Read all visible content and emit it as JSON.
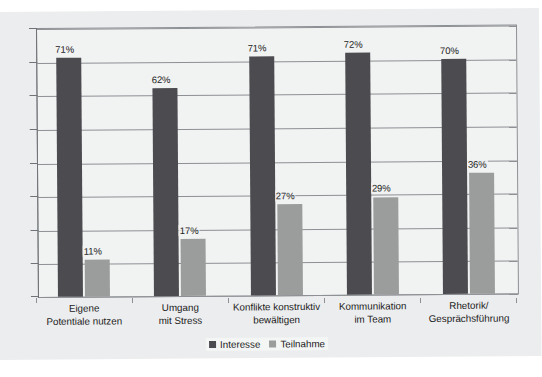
{
  "chart_data": {
    "type": "bar",
    "title": "",
    "subtitle": "",
    "xlabel": "",
    "ylabel": "",
    "ylim": [
      0,
      80
    ],
    "ytick_values": [
      0,
      10,
      20,
      30,
      40,
      50,
      60,
      70,
      80
    ],
    "ytick_labels": [],
    "grid": true,
    "legend_position": "bottom-center",
    "value_label_suffix": "%",
    "categories": [
      "Eigene\nPotentiale nutzen",
      "Umgang\nmit Stress",
      "Konflikte konstruktiv\nbewältigen",
      "Kommunikation\nim Team",
      "Rhetorik/\nGesprächsführung"
    ],
    "category_lines": [
      [
        "Eigene",
        "Potentiale nutzen"
      ],
      [
        "Umgang",
        "mit Stress"
      ],
      [
        "Konflikte konstruktiv",
        "bewältigen"
      ],
      [
        "Kommunikation",
        "im Team"
      ],
      [
        "Rhetorik/",
        "Gesprächsführung"
      ]
    ],
    "series": [
      {
        "name": "Interesse",
        "color": "#4b4b50",
        "values": [
          71,
          62,
          71,
          72,
          70
        ],
        "labels": [
          "71%",
          "62%",
          "71%",
          "72%",
          "70%"
        ]
      },
      {
        "name": "Teilnahme",
        "color": "#9b9c9c",
        "values": [
          11,
          17,
          27,
          29,
          36
        ],
        "labels": [
          "11%",
          "17%",
          "27%",
          "29%",
          "36%"
        ]
      }
    ]
  },
  "legend": {
    "items": [
      {
        "label": "Interesse",
        "color": "#4b4b50"
      },
      {
        "label": "Teilnahme",
        "color": "#9b9c9c"
      }
    ]
  },
  "colors": {
    "interesse": "#4b4b50",
    "teilnahme": "#9b9c9c",
    "plot_background": "#f1f2f2",
    "page_background": "#ecedee",
    "gridline": "#8d9094",
    "axis": "#6f7276",
    "text": "#1b1b1b"
  }
}
